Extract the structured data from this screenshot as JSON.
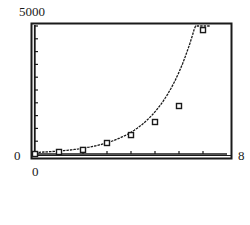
{
  "chart_data": {
    "type": "scatter",
    "title": "",
    "xlabel": "",
    "ylabel": "",
    "xlim": [
      0,
      8
    ],
    "ylim": [
      0,
      5000
    ],
    "x_tick_step": 1,
    "y_tick_step": 500,
    "grid": false,
    "legend": "none",
    "window_labels": {
      "xmin": "0",
      "xmax": "8",
      "ymin": "0",
      "ymax": "5000"
    },
    "series": [
      {
        "name": "data",
        "kind": "scatter",
        "marker": "hollow-square",
        "x": [
          0,
          1,
          2,
          3,
          4,
          5,
          6,
          7
        ],
        "y": [
          0,
          80,
          160,
          430,
          740,
          1250,
          1875,
          4840
        ]
      },
      {
        "name": "exponential fit",
        "kind": "line",
        "style": "dashed",
        "model": "y = a*b^x",
        "a": 60,
        "b": 1.94,
        "x_range": [
          0,
          7.3
        ]
      }
    ]
  },
  "colors": {
    "ink": "#1a1a1a",
    "background": "#ffffff"
  }
}
